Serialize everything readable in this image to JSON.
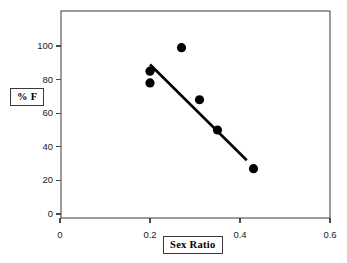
{
  "chart_data": {
    "type": "scatter",
    "title": "",
    "subtitle": "",
    "xlabel": "Sex Ratio",
    "ylabel": "% F",
    "xlim": [
      0,
      0.6
    ],
    "ylim": [
      0,
      110
    ],
    "grid": false,
    "legend": "none",
    "x_ticks": [
      {
        "value": 0,
        "label": "0"
      },
      {
        "value": 0.2,
        "label": "0.2"
      },
      {
        "value": 0.4,
        "label": "0.4"
      },
      {
        "value": 0.6,
        "label": "0.6"
      }
    ],
    "y_ticks": [
      {
        "value": 0,
        "label": "0"
      },
      {
        "value": 20,
        "label": "20"
      },
      {
        "value": 40,
        "label": "40"
      },
      {
        "value": 60,
        "label": "60"
      },
      {
        "value": 80,
        "label": "80"
      },
      {
        "value": 100,
        "label": "100"
      }
    ],
    "series": [
      {
        "name": "observations",
        "marker": "filled-circle",
        "color": "#000000",
        "marker_size": 5,
        "points": [
          {
            "x": 0.2,
            "y": 85
          },
          {
            "x": 0.2,
            "y": 78
          },
          {
            "x": 0.27,
            "y": 99
          },
          {
            "x": 0.31,
            "y": 68
          },
          {
            "x": 0.35,
            "y": 50
          },
          {
            "x": 0.43,
            "y": 27
          }
        ]
      }
    ],
    "trend_line": {
      "name": "fit-line",
      "color": "#000000",
      "width": 2.6,
      "x_start": 0.2,
      "y_start": 89,
      "x_end": 0.415,
      "y_end": 32
    },
    "colors": {
      "axis": "#4a4a4a",
      "marker": "#000000",
      "trend": "#000000",
      "background": "#ffffff",
      "text": "#1a1a1a"
    }
  },
  "labels": {
    "y_axis_title": "% F",
    "x_axis_title": "Sex Ratio"
  }
}
